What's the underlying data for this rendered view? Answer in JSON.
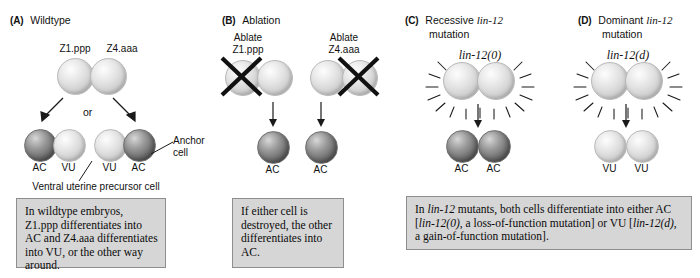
{
  "figure": {
    "background_color": "#ffffff",
    "caption_box_color": "#d6d6d6",
    "caption_border_color": "#8e8e8e",
    "cell_dark_color": "#5e5e5e",
    "cell_light_color": "#e2e2e2"
  },
  "panels": [
    {
      "tag": "(A)",
      "title": "Wildtype",
      "title_italic": "",
      "title_line2": "",
      "top_labels": [
        "Z1.ppp",
        "Z4.aaa"
      ],
      "middle_label": "or",
      "outcome_labels": [
        "AC",
        "VU",
        "VU",
        "AC"
      ],
      "annotations": {
        "anchor_cell_line1": "Anchor",
        "anchor_cell_line2": "cell",
        "precursor": "Ventral uterine precursor cell"
      },
      "caption": "In wildtype embryos, Z1.ppp differentiates into AC and Z4.aaa differentiates into VU, or the other way around."
    },
    {
      "tag": "(B)",
      "title": "Ablation",
      "title_italic": "",
      "title_line2": "",
      "ablate_labels": [
        {
          "line1": "Ablate",
          "line2": "Z1.ppp"
        },
        {
          "line1": "Ablate",
          "line2": "Z4.aaa"
        }
      ],
      "outcome_labels": [
        "AC",
        "AC"
      ],
      "caption": "If either cell is destroyed, the other differentiates into AC."
    },
    {
      "tag": "(C)",
      "title": "Recessive ",
      "title_italic": "lin-12",
      "title_line2": "mutation",
      "genotype": "lin-12(0)",
      "outcome_labels": [
        "AC",
        "AC"
      ]
    },
    {
      "tag": "(D)",
      "title": "Dominant ",
      "title_italic": "lin-12",
      "title_line2": "mutation",
      "genotype": "lin-12(d)",
      "outcome_labels": [
        "VU",
        "VU"
      ]
    }
  ],
  "shared_caption": {
    "part1": "In ",
    "gene1": "lin-12",
    "part2": " mutants, both cells differentiate into either AC [",
    "gene2": "lin-12(0)",
    "part3": ", a loss-of-function mutation] or VU [",
    "gene3": "lin-12(d)",
    "part4": ", a gain-of-function mutation]."
  }
}
